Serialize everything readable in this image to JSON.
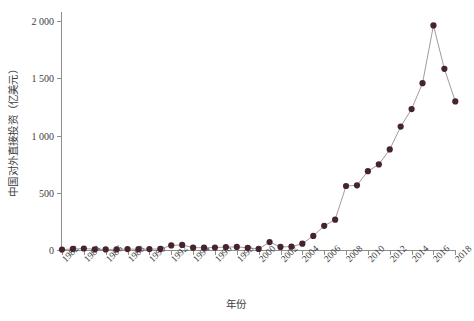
{
  "chart_data": {
    "type": "line",
    "title": "",
    "xlabel": "年份",
    "ylabel": "中国对外直接投资（亿美元）",
    "ylim": [
      0,
      2100
    ],
    "xlim": [
      1981,
      2019
    ],
    "yticks": [
      0,
      500,
      1000,
      1500,
      2000
    ],
    "ytick_labels": [
      "0",
      "500",
      "1 000",
      "1 500",
      "2 000"
    ],
    "xticks": [
      1982,
      1984,
      1986,
      1988,
      1990,
      1992,
      1994,
      1996,
      1998,
      2000,
      2002,
      2004,
      2006,
      2008,
      2010,
      2012,
      2014,
      2016,
      2018
    ],
    "xtick_labels": [
      "1982",
      "1984",
      "1986",
      "1988",
      "1990",
      "1992",
      "1994",
      "1996",
      "1998",
      "2000",
      "2002",
      "2004",
      "2006",
      "2008",
      "2010",
      "2012",
      "2014",
      "2016",
      "2018"
    ],
    "grid": false,
    "legend": null,
    "marker": "filled-circle",
    "marker_color": "#45232f",
    "line_color": "#9a8c92",
    "x": [
      1982,
      1983,
      1984,
      1985,
      1986,
      1987,
      1988,
      1989,
      1990,
      1991,
      1992,
      1993,
      1994,
      1995,
      1996,
      1997,
      1998,
      1999,
      2000,
      2001,
      2002,
      2003,
      2004,
      2005,
      2006,
      2007,
      2008,
      2009,
      2010,
      2011,
      2012,
      2013,
      2014,
      2015,
      2016,
      2017,
      2018
    ],
    "values": [
      4,
      9,
      13,
      6,
      5,
      6,
      8,
      7,
      8,
      9,
      40,
      44,
      20,
      20,
      21,
      26,
      27,
      19,
      9,
      69,
      27,
      29,
      55,
      123,
      211,
      265,
      559,
      565,
      688,
      747,
      878,
      1078,
      1231,
      1457,
      1961,
      1582,
      1298
    ]
  },
  "units": {
    "y_unit": "亿美元",
    "x_unit": "年"
  }
}
